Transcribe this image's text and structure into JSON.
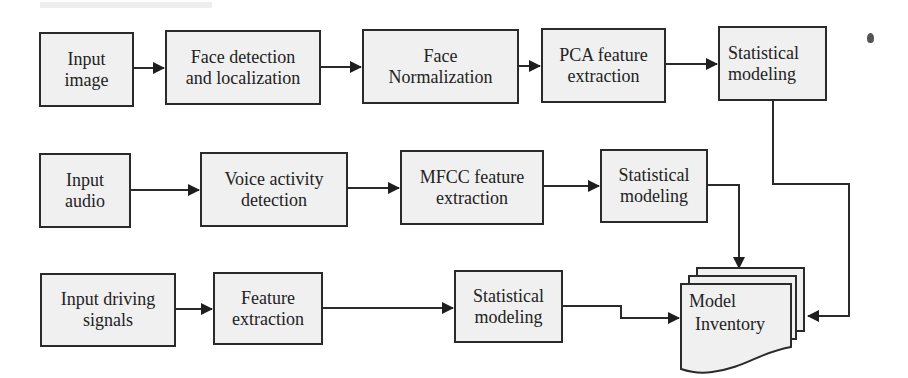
{
  "diagram": {
    "type": "flowchart",
    "rows": [
      {
        "name": "image-pipeline",
        "nodes": [
          {
            "id": "input-image",
            "label_line1": "Input",
            "label_line2": "image"
          },
          {
            "id": "face-detection",
            "label_line1": "Face detection",
            "label_line2": "and localization"
          },
          {
            "id": "face-normalization",
            "label_line1": "Face",
            "label_line2": "Normalization"
          },
          {
            "id": "pca-feature-extraction",
            "label_line1": "PCA feature",
            "label_line2": "extraction"
          },
          {
            "id": "statistical-modeling-image",
            "label_line1": "Statistical",
            "label_line2": "modeling"
          }
        ]
      },
      {
        "name": "audio-pipeline",
        "nodes": [
          {
            "id": "input-audio",
            "label_line1": "Input",
            "label_line2": "audio"
          },
          {
            "id": "voice-activity-detection",
            "label_line1": "Voice activity",
            "label_line2": "detection"
          },
          {
            "id": "mfcc-feature-extraction",
            "label_line1": "MFCC feature",
            "label_line2": "extraction"
          },
          {
            "id": "statistical-modeling-audio",
            "label_line1": "Statistical",
            "label_line2": "modeling"
          }
        ]
      },
      {
        "name": "driving-pipeline",
        "nodes": [
          {
            "id": "input-driving-signals",
            "label_line1": "Input driving",
            "label_line2": "signals"
          },
          {
            "id": "feature-extraction",
            "label_line1": "Feature",
            "label_line2": "extraction"
          },
          {
            "id": "statistical-modeling-driving",
            "label_line1": "Statistical",
            "label_line2": "modeling"
          }
        ]
      }
    ],
    "sink": {
      "id": "model-inventory",
      "label_line1": "Model",
      "label_line2": "Inventory"
    },
    "edges": [
      [
        "input-image",
        "face-detection"
      ],
      [
        "face-detection",
        "face-normalization"
      ],
      [
        "face-normalization",
        "pca-feature-extraction"
      ],
      [
        "pca-feature-extraction",
        "statistical-modeling-image"
      ],
      [
        "statistical-modeling-image",
        "model-inventory"
      ],
      [
        "input-audio",
        "voice-activity-detection"
      ],
      [
        "voice-activity-detection",
        "mfcc-feature-extraction"
      ],
      [
        "mfcc-feature-extraction",
        "statistical-modeling-audio"
      ],
      [
        "statistical-modeling-audio",
        "model-inventory"
      ],
      [
        "input-driving-signals",
        "feature-extraction"
      ],
      [
        "feature-extraction",
        "statistical-modeling-driving"
      ],
      [
        "statistical-modeling-driving",
        "model-inventory"
      ]
    ],
    "colors": {
      "box_fill": "#f0f0f0",
      "line": "#2a2a2a",
      "background": "#ffffff"
    }
  }
}
